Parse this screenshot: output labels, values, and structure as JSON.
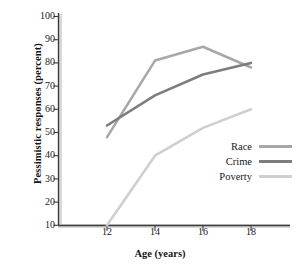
{
  "chart_data": {
    "type": "line",
    "title": "",
    "xlabel": "Age (years)",
    "ylabel": "Pessimistic responses (percent)",
    "x": [
      12,
      14,
      16,
      18
    ],
    "xlim": [
      11,
      19
    ],
    "ylim": [
      5,
      103
    ],
    "xticks": [
      "12",
      "14",
      "16",
      "18"
    ],
    "yticks": [
      "10",
      "20",
      "30",
      "40",
      "50",
      "60",
      "70",
      "80",
      "90",
      "100"
    ],
    "grid": false,
    "legend_position": "center-right",
    "series": [
      {
        "name": "Race",
        "values": [
          48,
          81,
          87,
          78
        ],
        "color": "#a8a8a8"
      },
      {
        "name": "Crime",
        "values": [
          53,
          66,
          75,
          80
        ],
        "color": "#7d7d7d"
      },
      {
        "name": "Poverty",
        "values": [
          10,
          40,
          52,
          60
        ],
        "color": "#cfcfcf"
      }
    ]
  },
  "axes": {
    "ylabel": "Pessimistic responses (percent)",
    "xlabel": "Age (years)",
    "yticks": [
      "100",
      "90",
      "80",
      "70",
      "60",
      "50",
      "40",
      "30",
      "20",
      "10"
    ],
    "xticks": [
      "12",
      "14",
      "16",
      "18"
    ]
  },
  "legend": {
    "items": [
      {
        "label": "Race"
      },
      {
        "label": "Crime"
      },
      {
        "label": "Poverty"
      }
    ]
  },
  "colors": {
    "race": "#a8a8a8",
    "crime": "#7d7d7d",
    "poverty": "#cfcfcf",
    "axis": "#3c3c3c",
    "axis_shadow": "#d6d6d6",
    "text": "#1a1a1a"
  }
}
